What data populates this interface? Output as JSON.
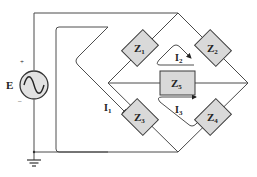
{
  "source": {
    "label": "E",
    "plus": "+",
    "minus": "–",
    "type": "ac-voltage-source"
  },
  "components": [
    {
      "id": "Z1",
      "main": "Z",
      "sub": "1"
    },
    {
      "id": "Z2",
      "main": "Z",
      "sub": "2"
    },
    {
      "id": "Z3",
      "main": "Z",
      "sub": "3"
    },
    {
      "id": "Z4",
      "main": "Z",
      "sub": "4"
    },
    {
      "id": "Z5",
      "main": "Z",
      "sub": "5"
    }
  ],
  "currents": [
    {
      "id": "I1",
      "main": "I",
      "sub": "1"
    },
    {
      "id": "I2",
      "main": "I",
      "sub": "2"
    },
    {
      "id": "I3",
      "main": "I",
      "sub": "3"
    }
  ],
  "colors": {
    "component_fill": "#d9d9d9",
    "wire": "#4a4a4a",
    "background": "#ffffff"
  }
}
